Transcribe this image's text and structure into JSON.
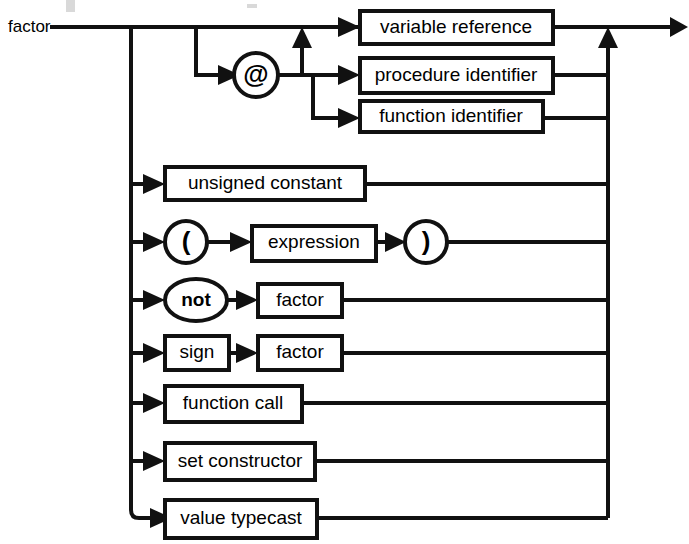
{
  "diagram": {
    "type": "railroad-syntax-diagram",
    "rule_name": "factor",
    "colors": {
      "line": "#111111",
      "box_fill": "#ffffff",
      "text": "#000000",
      "background": "#ffffff"
    },
    "entry_label": "factor",
    "alternatives": [
      {
        "id": "at-variable-reference",
        "nodes": [
          "@",
          "variable reference"
        ],
        "terminal_label": "@",
        "nonterminal_label": "variable reference"
      },
      {
        "id": "at-procedure-identifier",
        "nodes": [
          "@",
          "procedure identifier"
        ],
        "terminal_label": "@",
        "nonterminal_label": "procedure identifier"
      },
      {
        "id": "at-function-identifier",
        "nodes": [
          "@",
          "function identifier"
        ],
        "terminal_label": "@",
        "nonterminal_label": "function identifier"
      },
      {
        "id": "unsigned-constant",
        "nodes": [
          "unsigned constant"
        ],
        "nonterminal_label": "unsigned constant"
      },
      {
        "id": "parenthesized-expression",
        "nodes": [
          "(",
          "expression",
          ")"
        ],
        "nonterminal_label": "expression",
        "open_paren": "(",
        "close_paren": ")"
      },
      {
        "id": "not-factor",
        "nodes": [
          "not",
          "factor"
        ],
        "terminal_label": "not",
        "nonterminal_label": "factor"
      },
      {
        "id": "sign-factor",
        "nodes": [
          "sign",
          "factor"
        ],
        "first_label": "sign",
        "nonterminal_label": "factor"
      },
      {
        "id": "function-call",
        "nodes": [
          "function call"
        ],
        "nonterminal_label": "function call"
      },
      {
        "id": "set-constructor",
        "nodes": [
          "set constructor"
        ],
        "nonterminal_label": "set constructor"
      },
      {
        "id": "value-typecast",
        "nodes": [
          "value typecast"
        ],
        "nonterminal_label": "value typecast"
      }
    ],
    "labels": {
      "at_sign": "@",
      "variable_reference": "variable reference",
      "procedure_identifier": "procedure identifier",
      "function_identifier": "function identifier",
      "unsigned_constant": "unsigned constant",
      "open_paren": "(",
      "expression": "expression",
      "close_paren": ")",
      "not": "not",
      "factor_not": "factor",
      "sign": "sign",
      "factor_sign": "factor",
      "function_call": "function call",
      "set_constructor": "set constructor",
      "value_typecast": "value typecast"
    }
  }
}
